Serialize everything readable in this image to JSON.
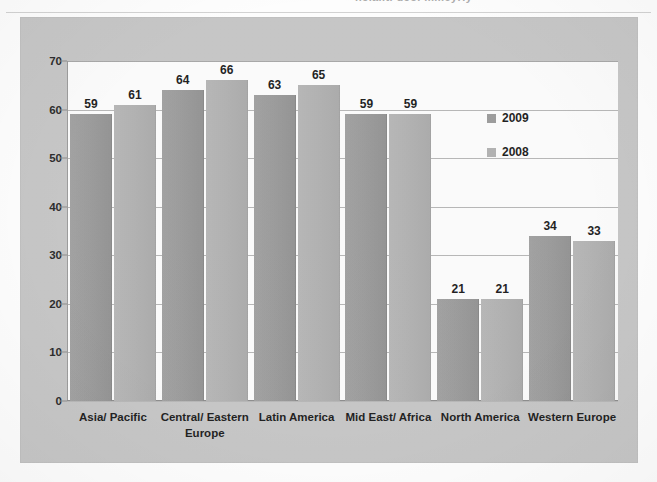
{
  "page": {
    "title_remnant": "hcialitl dcoi mmeyriy"
  },
  "legend": {
    "position": "inside-top-right",
    "entries": [
      {
        "label": "2009",
        "color": "#9d9d9d"
      },
      {
        "label": "2008",
        "color": "#b4b4b4"
      }
    ]
  },
  "axis": {
    "y_ticks": [
      "70",
      "60",
      "50",
      "40",
      "30",
      "20",
      "10",
      "0"
    ]
  },
  "chart_data": {
    "type": "bar",
    "title": "",
    "subtitle": "",
    "xlabel": "",
    "ylabel": "",
    "ylim": [
      0,
      70
    ],
    "ytick_step": 10,
    "grid": true,
    "legend_position": "inside-top-right",
    "categories": [
      "Asia/ Pacific",
      "Central/ Eastern Europe",
      "Latin America",
      "Mid East/ Africa",
      "North America",
      "Western Europe"
    ],
    "series": [
      {
        "name": "2009",
        "color": "#9d9d9d",
        "values": [
          59,
          64,
          63,
          59,
          21,
          34
        ]
      },
      {
        "name": "2008",
        "color": "#b4b4b4",
        "values": [
          61,
          66,
          65,
          59,
          21,
          33
        ]
      }
    ]
  }
}
